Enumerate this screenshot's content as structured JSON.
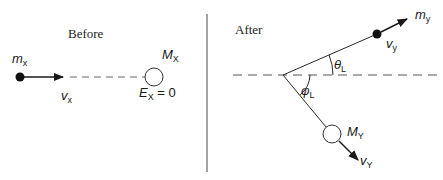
{
  "diagram": {
    "before": {
      "title": "Before",
      "projectile_label": "m",
      "projectile_sub": "x",
      "velocity_label": "v",
      "velocity_sub": "x",
      "target_label": "M",
      "target_sub": "X",
      "energy_label": "E",
      "energy_sub": "X",
      "energy_value": " = 0"
    },
    "after": {
      "title": "After",
      "ejectile_label": "m",
      "ejectile_sub": "y",
      "ejectile_velocity_label": "v",
      "ejectile_velocity_sub": "y",
      "theta_label": "θ",
      "theta_sub": "L",
      "phi_label": "φ",
      "phi_sub": "L",
      "residual_label": "M",
      "residual_sub": "Y",
      "residual_velocity_label": "v",
      "residual_velocity_sub": "Y"
    },
    "colors": {
      "line": "#2a2a2a",
      "dashed": "#555555",
      "dot": "#111111",
      "divider": "#666666"
    }
  }
}
